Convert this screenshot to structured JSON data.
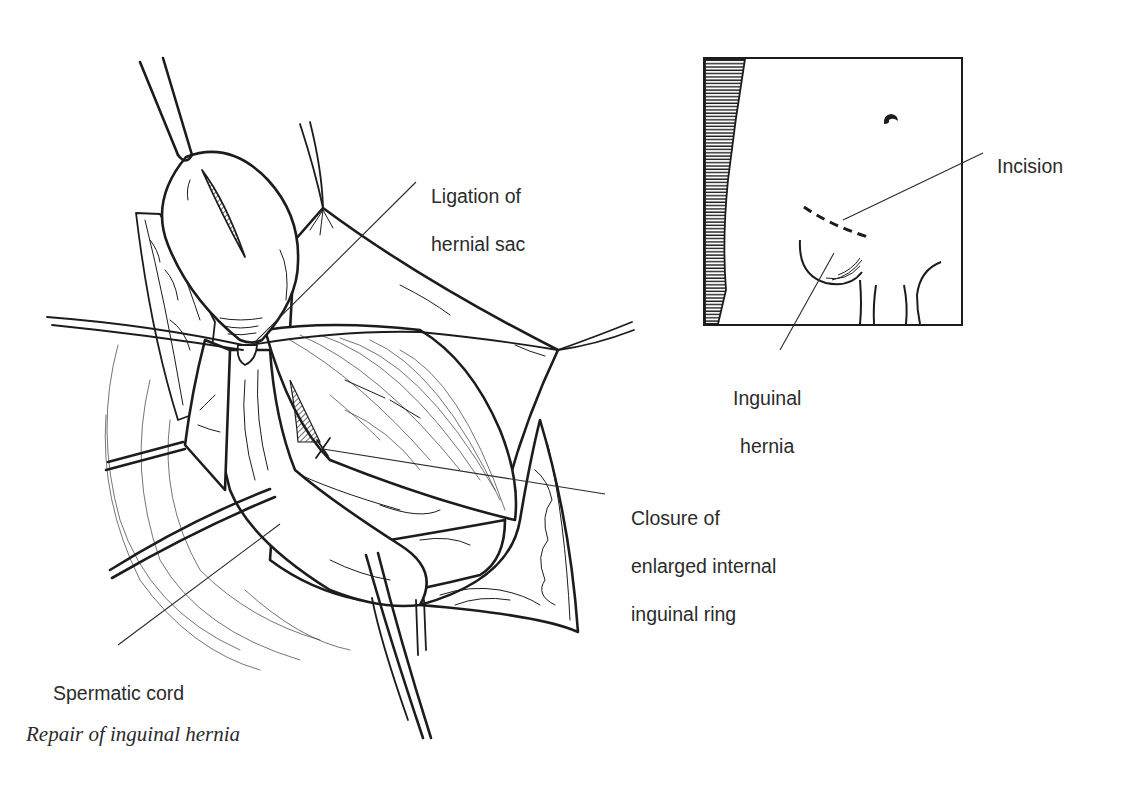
{
  "figure": {
    "caption": "Repair of inguinal hernia",
    "ink_color": "#1c1c1c",
    "text_color": "#2b2b2b",
    "background": "#ffffff"
  },
  "main_illustration": {
    "description": "Operative field view: hernial sac ligated and retracted, spermatic cord retracted, enlarged internal inguinal ring closed",
    "labels": {
      "ligation": {
        "line1": "Ligation of",
        "line2": "hernial sac"
      },
      "closure": {
        "line1": "Closure of",
        "line2": "enlarged internal",
        "line3": "inguinal ring"
      },
      "cord": {
        "line1": "Spermatic cord"
      }
    }
  },
  "inset": {
    "description": "Body outline showing incision site and inguinal hernia",
    "labels": {
      "incision": {
        "line1": "Incision"
      },
      "hernia": {
        "line1": "Inguinal",
        "line2": "hernia"
      }
    }
  }
}
